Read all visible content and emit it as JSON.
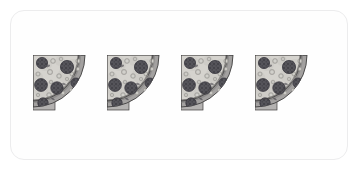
{
  "canvas": {
    "width": 360,
    "height": 172,
    "background_color": "#ffffff"
  },
  "card": {
    "name": "image-card",
    "background_color": "#fefefe",
    "border_color": "#ececed",
    "corner_radius_px": 14
  },
  "scene": {
    "title": "Four pizza quarter slices in a row",
    "subject": "pizza-quarter",
    "count": 4,
    "orientation": "corner-top-left-arc-bottom-right",
    "color_mode": "grayscale",
    "arrangement": "horizontal-row",
    "spacing_px": 16
  },
  "palette": {
    "cheese": "#d5d3ce",
    "cheese_shade": "#c6c4bf",
    "crust_outer": "#a3a1a0",
    "crust_inner": "#8e8c8b",
    "crust_band": "#b4b2b1",
    "outline_dark": "#3f3e3e",
    "pepperoni": "#55545a",
    "pepperoni_dark": "#3a3940",
    "pepperoni_speck": "#2c2b31",
    "onion_ring": "#bdbbb7",
    "onion_ring_edge": "#9a9894",
    "base_shadow": "#9c9a99"
  },
  "slices": [
    {
      "index": 1,
      "label": "pizza-quarter-1",
      "x_px": 42,
      "y_px": 54,
      "width_px": 58,
      "height_px": 62
    },
    {
      "index": 2,
      "label": "pizza-quarter-2",
      "x_px": 117,
      "y_px": 54,
      "width_px": 58,
      "height_px": 62
    },
    {
      "index": 3,
      "label": "pizza-quarter-3",
      "x_px": 192,
      "y_px": 54,
      "width_px": 58,
      "height_px": 62
    },
    {
      "index": 4,
      "label": "pizza-quarter-4",
      "x_px": 259,
      "y_px": 54,
      "width_px": 58,
      "height_px": 62
    }
  ],
  "toppings": {
    "pepperoni": [
      {
        "cx": 9,
        "cy": 8,
        "r": 5.6
      },
      {
        "cx": 8,
        "cy": 30,
        "r": 6.4
      },
      {
        "cx": 34,
        "cy": 12,
        "r": 6.6
      },
      {
        "cx": 24,
        "cy": 33,
        "r": 6.2
      },
      {
        "cx": 43,
        "cy": 28,
        "r": 5.0
      },
      {
        "cx": 10,
        "cy": 48,
        "r": 5.2
      },
      {
        "cx": 31,
        "cy": 47,
        "r": 3.4
      }
    ],
    "rings": [
      {
        "cx": 20,
        "cy": 6,
        "r": 2.4
      },
      {
        "cx": 28,
        "cy": 4,
        "r": 1.8
      },
      {
        "cx": 45,
        "cy": 6,
        "r": 2.2
      },
      {
        "cx": 17,
        "cy": 17,
        "r": 2.6
      },
      {
        "cx": 26,
        "cy": 21,
        "r": 2.3
      },
      {
        "cx": 39,
        "cy": 19,
        "r": 2.0
      },
      {
        "cx": 45,
        "cy": 14,
        "r": 1.9
      },
      {
        "cx": 5,
        "cy": 19,
        "r": 2.1
      },
      {
        "cx": 18,
        "cy": 27,
        "r": 1.8
      },
      {
        "cx": 34,
        "cy": 24,
        "r": 1.7
      },
      {
        "cx": 16,
        "cy": 40,
        "r": 2.3
      },
      {
        "cx": 30,
        "cy": 38,
        "r": 2.0
      },
      {
        "cx": 38,
        "cy": 35,
        "r": 1.8
      },
      {
        "cx": 5,
        "cy": 40,
        "r": 1.7
      },
      {
        "cx": 22,
        "cy": 50,
        "r": 1.9
      },
      {
        "cx": 7,
        "cy": 56,
        "r": 1.6
      },
      {
        "cx": 14,
        "cy": 53,
        "r": 1.5
      },
      {
        "cx": 36,
        "cy": 15,
        "r": 1.5
      }
    ],
    "herbs": [
      {
        "cx": 15,
        "cy": 11,
        "rx": 2.2,
        "ry": 1.2,
        "rot": -22
      },
      {
        "cx": 31,
        "cy": 29,
        "rx": 2.0,
        "ry": 1.1,
        "rot": 15
      },
      {
        "cx": 41,
        "cy": 40,
        "rx": 2.1,
        "ry": 1.0,
        "rot": -40
      },
      {
        "cx": 20,
        "cy": 44,
        "rx": 1.9,
        "ry": 1.0,
        "rot": 30
      },
      {
        "cx": 4,
        "cy": 27,
        "rx": 1.8,
        "ry": 0.9,
        "rot": -10
      },
      {
        "cx": 38,
        "cy": 7,
        "rx": 1.7,
        "ry": 0.9,
        "rot": 48
      }
    ]
  }
}
